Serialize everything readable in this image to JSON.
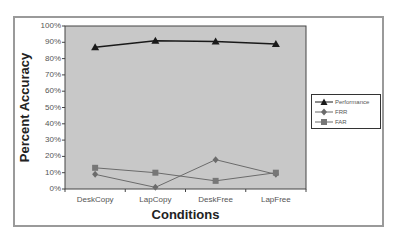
{
  "chart_data": {
    "type": "line",
    "title": "",
    "xlabel": "Conditions",
    "ylabel": "Percent Accuracy",
    "categories": [
      "DeskCopy",
      "LapCopy",
      "DeskFree",
      "LapFree"
    ],
    "yticks": [
      "100%",
      "90%",
      "80%",
      "70%",
      "60%",
      "50%",
      "40%",
      "30%",
      "20%",
      "10%",
      "0%"
    ],
    "ylim": [
      0,
      100
    ],
    "grid": false,
    "legend_position": "right",
    "series": [
      {
        "name": "Performance",
        "marker": "triangle",
        "color": "#1a1a1a",
        "values": [
          87,
          91,
          90.5,
          89
        ]
      },
      {
        "name": "FRR",
        "marker": "diamond",
        "color": "#6b6b6b",
        "values": [
          9,
          1,
          18,
          9
        ]
      },
      {
        "name": "FAR",
        "marker": "square",
        "color": "#6b6b6b",
        "values": [
          13,
          10,
          5,
          10
        ]
      }
    ],
    "plot_background": "#c8c8c8"
  },
  "labels": {
    "ylabel": "Percent Accuracy",
    "xlabel": "Conditions",
    "yticks": [
      "100%",
      "90%",
      "80%",
      "70%",
      "60%",
      "50%",
      "40%",
      "30%",
      "20%",
      "10%",
      "0%"
    ],
    "xticks": [
      "DeskCopy",
      "LapCopy",
      "DeskFree",
      "LapFree"
    ],
    "legend": [
      "Performance",
      "FRR",
      "FAR"
    ]
  }
}
